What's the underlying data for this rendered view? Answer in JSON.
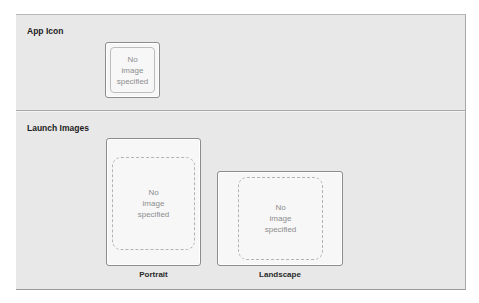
{
  "app_icon": {
    "section_label": "App Icon",
    "placeholder": [
      "No",
      "image",
      "specified"
    ]
  },
  "launch_images": {
    "section_label": "Launch Images",
    "portrait": {
      "placeholder": [
        "No",
        "image",
        "specified"
      ],
      "caption": "Portrait"
    },
    "landscape": {
      "placeholder": [
        "No",
        "image",
        "specified"
      ],
      "caption": "Landscape"
    }
  }
}
